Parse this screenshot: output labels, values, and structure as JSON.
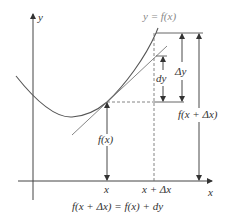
{
  "diagram": {
    "type": "differential-approximation",
    "curve_label": "y = f(x)",
    "y_axis_label": "y",
    "x_axis_label": "x",
    "x_tick_labels": [
      "x",
      "x + Δx"
    ],
    "measure_labels": {
      "fx": "f(x)",
      "f_x_plus_dx": "f(x + Δx)",
      "delta_y": "Δy",
      "dy": "dy"
    },
    "formula": "f(x + Δx) = f(x) + dy",
    "colors": {
      "curve": "#555555",
      "tangent": "#777777",
      "axes": "#444444",
      "text": "#333333",
      "curve_label": "#888888"
    }
  }
}
